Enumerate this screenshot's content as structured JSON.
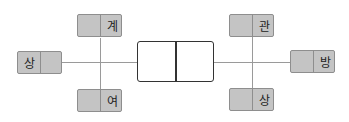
{
  "diagram": {
    "type": "connection-diagram",
    "center": {
      "cells": [
        "",
        ""
      ]
    },
    "left_group": {
      "top": {
        "label": "계"
      },
      "left": {
        "label": "상"
      },
      "bottom": {
        "label": "여"
      }
    },
    "right_group": {
      "top": {
        "label": "관"
      },
      "right": {
        "label": "방"
      },
      "bottom": {
        "label": "상"
      }
    },
    "colors": {
      "tag_fill": "#c4c4c4",
      "tag_border": "#8e8e8e",
      "line": "#9a9a9a",
      "center_border": "#333333"
    }
  }
}
